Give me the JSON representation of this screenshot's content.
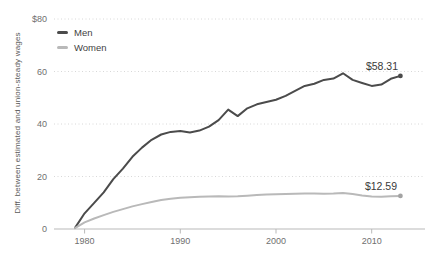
{
  "chart_data": {
    "type": "line",
    "title": "",
    "ylabel": "Diff. between estimated and union-steady wages",
    "xlabel": "",
    "legend_position": "top-left",
    "grid": "dotted-horizontal",
    "ylim": [
      0,
      80
    ],
    "xlim": [
      1979,
      2014
    ],
    "y_ticks": [
      {
        "value": 80,
        "label": "$80"
      },
      {
        "value": 60,
        "label": "60"
      },
      {
        "value": 40,
        "label": "40"
      },
      {
        "value": 20,
        "label": "20"
      },
      {
        "value": 0,
        "label": "0"
      }
    ],
    "x_ticks": [
      {
        "value": 1980,
        "label": "1980"
      },
      {
        "value": 1990,
        "label": "1990"
      },
      {
        "value": 2000,
        "label": "2000"
      },
      {
        "value": 2010,
        "label": "2010"
      }
    ],
    "x": [
      1979,
      1980,
      1981,
      1982,
      1983,
      1984,
      1985,
      1986,
      1987,
      1988,
      1989,
      1990,
      1991,
      1992,
      1993,
      1994,
      1995,
      1996,
      1997,
      1998,
      1999,
      2000,
      2001,
      2002,
      2003,
      2004,
      2005,
      2006,
      2007,
      2008,
      2009,
      2010,
      2011,
      2012,
      2013
    ],
    "series": [
      {
        "name": "Men",
        "color": "#4b4b4b",
        "end_label": "$58.31",
        "end_value": 58.31,
        "values": [
          0.4,
          6,
          10,
          14,
          19,
          23,
          27.5,
          31,
          34,
          36,
          37,
          37.3,
          36.8,
          37.5,
          39,
          41.5,
          45.5,
          43,
          46,
          47.5,
          48.4,
          49.2,
          50.7,
          52.6,
          54.5,
          55.3,
          56.8,
          57.3,
          59.3,
          56.8,
          55.6,
          54.5,
          55,
          57.2,
          58.31
        ]
      },
      {
        "name": "Women",
        "color": "#b9b9b9",
        "end_label": "$12.59",
        "end_value": 12.59,
        "values": [
          0.3,
          2.5,
          4,
          5.3,
          6.5,
          7.6,
          8.6,
          9.5,
          10.3,
          11,
          11.5,
          11.9,
          12.1,
          12.3,
          12.4,
          12.5,
          12.4,
          12.5,
          12.7,
          12.9,
          13.1,
          13.2,
          13.3,
          13.4,
          13.5,
          13.5,
          13.4,
          13.5,
          13.7,
          13.3,
          12.8,
          12.4,
          12.3,
          12.5,
          12.59
        ]
      }
    ],
    "colors": {
      "background": "#ffffff",
      "gridline": "#d8d8d8",
      "axis_line": "#b9b9b9",
      "tick_label": "#6f6f6f",
      "legend_text": "#3f3f3f",
      "end_label_text": "#3a3a3a",
      "women_end_dot": "#a3a3a3"
    }
  }
}
